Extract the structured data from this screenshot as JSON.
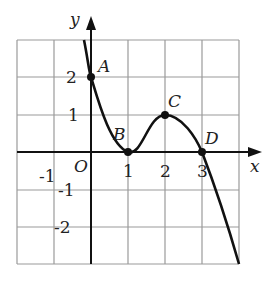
{
  "figure": {
    "type": "function-graph",
    "axes": {
      "x_label": "x",
      "y_label": "y",
      "origin_label": "O"
    },
    "x_ticks": [
      "-1",
      "1",
      "2",
      "3"
    ],
    "y_ticks": [
      "2",
      "1",
      "-1",
      "-2"
    ],
    "points": [
      {
        "name": "A",
        "x": 0,
        "y": 2
      },
      {
        "name": "B",
        "x": 1,
        "y": 0
      },
      {
        "name": "C",
        "x": 2,
        "y": 1
      },
      {
        "name": "D",
        "x": 3,
        "y": 0
      }
    ],
    "grid": {
      "x_range": [
        -2,
        4
      ],
      "y_range": [
        -3,
        3
      ],
      "step": 1
    }
  }
}
